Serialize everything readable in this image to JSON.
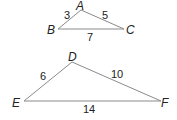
{
  "triangles": [
    {
      "name": "ABC",
      "vertices": {
        "A": {
          "label": "A",
          "x": 81,
          "y": 10
        },
        "B": {
          "label": "B",
          "x": 58,
          "y": 29
        },
        "C": {
          "label": "C",
          "x": 124,
          "y": 29
        }
      },
      "sides": {
        "AB": "3",
        "AC": "5",
        "BC": "7"
      }
    },
    {
      "name": "DEF",
      "vertices": {
        "D": {
          "label": "D",
          "x": 72,
          "y": 62
        },
        "E": {
          "label": "E",
          "x": 24,
          "y": 101
        },
        "F": {
          "label": "F",
          "x": 161,
          "y": 101
        }
      },
      "sides": {
        "DE": "6",
        "DF": "10",
        "EF": "14"
      }
    }
  ],
  "colors": {
    "edge": "#8a8a8a",
    "text": "#222222"
  }
}
